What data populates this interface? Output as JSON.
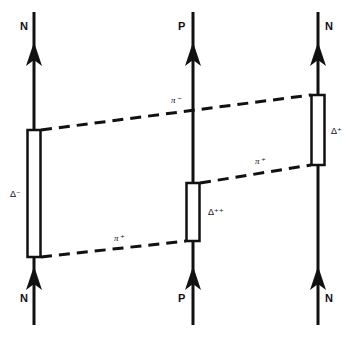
{
  "diagram": {
    "columns": [
      {
        "top_label": "N",
        "bottom_label": "P_placeholder"
      }
    ],
    "labels": {
      "left_top": "N",
      "left_bottom": "N",
      "middle_top": "P",
      "middle_bottom": "P",
      "right_top": "N",
      "right_bottom": "N",
      "delta_minus": "Δ⁻",
      "delta_plus_plus": "Δ⁺⁺",
      "delta_plus": "Δ⁺",
      "pion_minus": "π⁻",
      "pion_plus_upper": "π⁺",
      "pion_plus_lower": "π⁺"
    },
    "colors": {
      "ink": "#111111",
      "background": "#ffffff"
    }
  }
}
